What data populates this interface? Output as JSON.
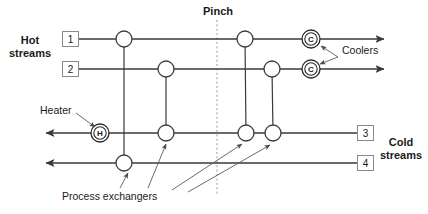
{
  "diagram": {
    "title_label": "Pinch",
    "hot_streams_label": "Hot\nstreams",
    "hot_streams_line1": "Hot",
    "hot_streams_line2": "streams",
    "cold_streams_line1": "Cold",
    "cold_streams_line2": "streams",
    "heater_label": "Heater",
    "coolers_label": "Coolers",
    "process_exchangers_label": "Process exchangers",
    "colors": {
      "line": "#3a3a3a",
      "text": "#1a1a1a",
      "box_border": "#8a8a8a",
      "pinch_line": "#9a9a9a",
      "leader": "#6f6f6f",
      "background": "#ffffff"
    },
    "stream_boxes": [
      {
        "id": "stream-1",
        "label": "1",
        "x": 62,
        "y": 31,
        "side": "left"
      },
      {
        "id": "stream-2",
        "label": "2",
        "x": 62,
        "y": 61,
        "side": "left"
      },
      {
        "id": "stream-3",
        "label": "3",
        "x": 357,
        "y": 125,
        "side": "right"
      },
      {
        "id": "stream-4",
        "label": "4",
        "x": 357,
        "y": 155,
        "side": "right"
      }
    ],
    "stream_lines": [
      {
        "id": "line-hot-1",
        "y": 39,
        "x_start": 79,
        "x_end": 392,
        "direction": "right",
        "type": "hot"
      },
      {
        "id": "line-hot-2",
        "y": 69,
        "x_start": 79,
        "x_end": 392,
        "direction": "right",
        "type": "hot"
      },
      {
        "id": "line-cold-3",
        "y": 133,
        "x_start": 357,
        "x_end": 38,
        "direction": "left",
        "type": "cold"
      },
      {
        "id": "line-cold-4",
        "y": 163,
        "x_start": 357,
        "x_end": 38,
        "direction": "left",
        "type": "cold"
      }
    ],
    "pinch_line": {
      "x": 217,
      "y_start": 20,
      "y_end": 196
    },
    "exchangers": [
      {
        "id": "ex-a-hot",
        "x": 124,
        "y": 39,
        "r": 8
      },
      {
        "id": "ex-a-cold",
        "x": 124,
        "y": 163,
        "r": 8
      },
      {
        "id": "ex-b-hot",
        "x": 166,
        "y": 69,
        "r": 8
      },
      {
        "id": "ex-b-cold",
        "x": 166,
        "y": 133,
        "r": 8
      },
      {
        "id": "ex-c-hot",
        "x": 245,
        "y": 39,
        "r": 8
      },
      {
        "id": "ex-c-cold",
        "x": 246,
        "y": 133,
        "r": 8
      },
      {
        "id": "ex-d-hot",
        "x": 272,
        "y": 69,
        "r": 8
      },
      {
        "id": "ex-d-cold",
        "x": 273,
        "y": 133,
        "r": 8
      }
    ],
    "exchanger_couplings": [
      {
        "id": "couple-a",
        "x": 124,
        "y_top": 39,
        "y_bottom": 163
      },
      {
        "id": "couple-b",
        "x": 166,
        "y_top": 69,
        "y_bottom": 133
      },
      {
        "id": "couple-c",
        "x": 245,
        "y_top": 39,
        "y_bottom": 133
      },
      {
        "id": "couple-d",
        "x": 272,
        "y_top": 69,
        "y_bottom": 133
      }
    ],
    "utilities": [
      {
        "id": "cooler-1",
        "kind": "cooler",
        "symbol": "C",
        "x": 311,
        "y": 39,
        "r_outer": 9,
        "r_inner": 6.5
      },
      {
        "id": "cooler-2",
        "kind": "cooler",
        "symbol": "C",
        "x": 311,
        "y": 69,
        "r_outer": 9,
        "r_inner": 6.5
      },
      {
        "id": "heater-1",
        "kind": "heater",
        "symbol": "H",
        "x": 100,
        "y": 133,
        "r_outer": 9,
        "r_inner": 6.5
      }
    ],
    "text_labels": [
      {
        "id": "label-pinch",
        "text": "Pinch",
        "x": 198,
        "y": 6,
        "bold": true
      },
      {
        "id": "label-hot-streams",
        "text": "Hot streams",
        "x": 8,
        "y": 36,
        "bold": true
      },
      {
        "id": "label-cold-streams",
        "text": "Cold streams",
        "x": 378,
        "y": 133,
        "bold": true
      },
      {
        "id": "label-heater",
        "text": "Heater",
        "x": 41,
        "y": 106,
        "bold": false
      },
      {
        "id": "label-coolers",
        "text": "Coolers",
        "x": 342,
        "y": 45,
        "bold": false
      },
      {
        "id": "label-process-exchangers",
        "text": "Process exchangers",
        "x": 62,
        "y": 190,
        "bold": false
      }
    ],
    "leaders": [
      {
        "id": "leader-heater",
        "x1": 76,
        "y1": 113,
        "x2": 94,
        "y2": 127
      },
      {
        "id": "leader-cooler-1",
        "x1": 338,
        "y1": 57,
        "x2": 320,
        "y2": 45
      },
      {
        "id": "leader-cooler-2",
        "x1": 338,
        "y1": 57,
        "x2": 319,
        "y2": 65
      },
      {
        "id": "leader-pe-1",
        "x1": 120,
        "y1": 188,
        "x2": 128,
        "y2": 172
      },
      {
        "id": "leader-pe-2",
        "x1": 146,
        "y1": 188,
        "x2": 165,
        "y2": 143
      },
      {
        "id": "leader-pe-3",
        "x1": 172,
        "y1": 190,
        "x2": 243,
        "y2": 143
      },
      {
        "id": "leader-pe-4",
        "x1": 186,
        "y1": 191,
        "x2": 271,
        "y2": 144
      }
    ]
  }
}
